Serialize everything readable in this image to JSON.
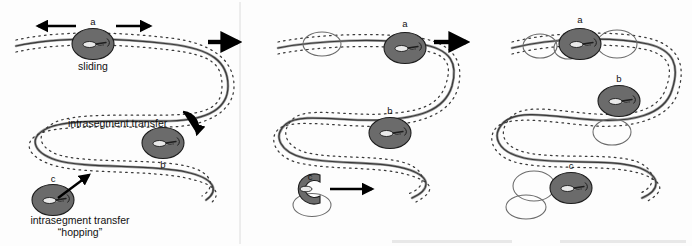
{
  "figure": {
    "background_color": "#fdfdfd",
    "protein_color": "#6b6b6b",
    "dna_color": "#3a3a3a",
    "site_circle_color": "#6b6b6b",
    "arrow_color": "#000000",
    "width": 692,
    "height": 246
  },
  "panels": [
    {
      "id": "panel-left",
      "name": "initial-state",
      "proteins": [
        {
          "id": "a",
          "label": "a",
          "state": "closed-clamp",
          "position": "top-strand"
        },
        {
          "id": "b",
          "label": "b",
          "state": "closed-clamp",
          "position": "middle-strand"
        },
        {
          "id": "c",
          "label": "c",
          "state": "closed-clamp",
          "position": "bottom-strand"
        }
      ],
      "annotations": [
        {
          "id": "sliding",
          "text": "sliding"
        },
        {
          "id": "intrasegment-transfer",
          "text": "intrasegment transfer"
        },
        {
          "id": "hopping-line1",
          "text": "intrasegment transfer"
        },
        {
          "id": "hopping-line2",
          "text": "“hopping”"
        }
      ],
      "arrows": [
        {
          "id": "slide-left",
          "direction": "left",
          "meaning": "sliding along DNA"
        },
        {
          "id": "slide-right",
          "direction": "right",
          "meaning": "sliding along DNA"
        },
        {
          "id": "transfer-curve",
          "direction": "curved-down",
          "meaning": "intrasegment transfer"
        },
        {
          "id": "hop-arrow",
          "direction": "up-right",
          "meaning": "hopping"
        }
      ]
    },
    {
      "id": "panel-middle",
      "name": "intermediate-state",
      "proteins": [
        {
          "id": "a",
          "label": "a",
          "state": "closed-clamp",
          "position": "top-strand"
        },
        {
          "id": "b",
          "label": "b",
          "state": "closed-clamp",
          "position": "middle-strand"
        },
        {
          "id": "c",
          "label": "c",
          "state": "open-clamp",
          "position": "bottom-strand"
        }
      ],
      "site_circles": 2,
      "arrows": [
        {
          "id": "c-move",
          "direction": "right",
          "meaning": "protein c departs site"
        }
      ]
    },
    {
      "id": "panel-right",
      "name": "final-state",
      "proteins": [
        {
          "id": "a",
          "label": "a",
          "state": "closed-clamp",
          "position": "top-strand"
        },
        {
          "id": "b",
          "label": "b",
          "state": "closed-clamp",
          "position": "middle-strand"
        },
        {
          "id": "c",
          "label": "c",
          "state": "closed-clamp",
          "position": "bottom-strand"
        }
      ],
      "site_circles": 6
    }
  ],
  "transitions": [
    {
      "id": "arrow-1",
      "from": "panel-left",
      "to": "panel-middle",
      "glyph": "→"
    },
    {
      "id": "arrow-2",
      "from": "panel-middle",
      "to": "panel-right",
      "glyph": "→"
    }
  ],
  "labels": {
    "a": "a",
    "b": "b",
    "c": "c",
    "sliding": "sliding",
    "intrasegment_transfer": "intrasegment transfer",
    "hopping_quoted": "“hopping”"
  }
}
